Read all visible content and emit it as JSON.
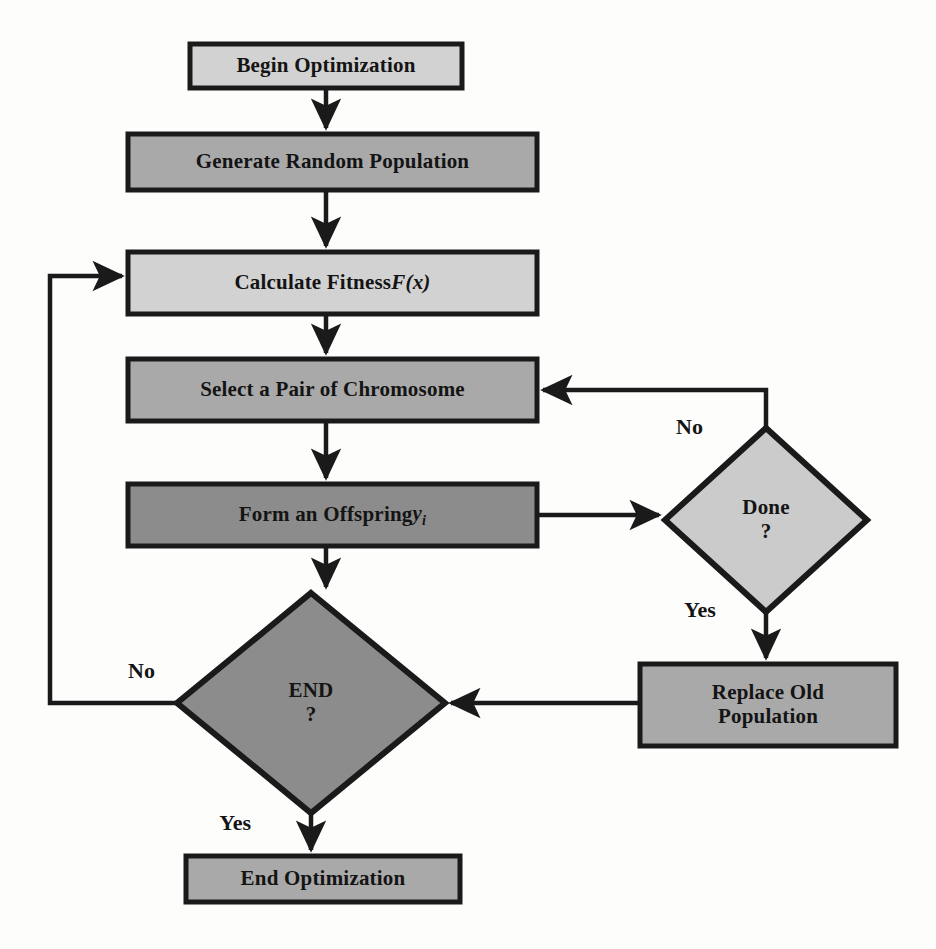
{
  "diagram": {
    "type": "flowchart",
    "background_color": "#fdfdfc",
    "stroke_color": "#1a1a1a",
    "text_color": "#141414",
    "palette": {
      "light_gray": "#d2d2d2",
      "medium_gray": "#a9a9a9",
      "dark_gray": "#8c8c8c",
      "diamond_light": "#cbcbcb",
      "diamond_dark": "#8c8c8c"
    }
  },
  "nodes": {
    "begin": {
      "label": "Begin Optimization",
      "shape": "rectangle",
      "fill": "#d2d2d2",
      "x": 190,
      "y": 44,
      "w": 272,
      "h": 44,
      "font_size": 21
    },
    "generate": {
      "label": "Generate Random Population",
      "shape": "rectangle",
      "fill": "#a9a9a9",
      "x": 128,
      "y": 134,
      "w": 409,
      "h": 56,
      "font_size": 21
    },
    "fitness": {
      "label_prefix": "Calculate Fitness ",
      "label_math": "F(x)",
      "label": "Calculate Fitness F(x)",
      "shape": "rectangle",
      "fill": "#d2d2d2",
      "x": 128,
      "y": 252,
      "w": 409,
      "h": 62,
      "font_size": 21
    },
    "select": {
      "label": "Select a Pair of Chromosome",
      "shape": "rectangle",
      "fill": "#a9a9a9",
      "x": 128,
      "y": 359,
      "w": 409,
      "h": 62,
      "font_size": 21
    },
    "offspring": {
      "label_prefix": "Form an Offspring ",
      "label_math": "y",
      "label_sub": "i",
      "label": "Form an Offspring yi",
      "shape": "rectangle",
      "fill": "#8c8c8c",
      "x": 128,
      "y": 484,
      "w": 409,
      "h": 62,
      "font_size": 21
    },
    "done": {
      "label_line1": "Done",
      "label_line2": "?",
      "label": "Done ?",
      "shape": "diamond",
      "fill": "#cbcbcb",
      "cx": 766,
      "cy": 520,
      "rx": 101,
      "ry": 92,
      "font_size": 21
    },
    "replace": {
      "label_line1": "Replace Old",
      "label_line2": "Population",
      "label": "Replace Old Population",
      "shape": "rectangle",
      "fill": "#a9a9a9",
      "x": 640,
      "y": 664,
      "w": 256,
      "h": 82,
      "font_size": 21
    },
    "end_decision": {
      "label_line1": "END",
      "label_line2": "?",
      "label": "END ?",
      "shape": "diamond",
      "fill": "#8c8c8c",
      "cx": 311,
      "cy": 703,
      "rx": 134,
      "ry": 110,
      "font_size": 21
    },
    "end_opt": {
      "label": "End Optimization",
      "shape": "rectangle",
      "fill": "#a9a9a9",
      "x": 186,
      "y": 856,
      "w": 274,
      "h": 46,
      "font_size": 21
    }
  },
  "edges": [
    {
      "id": "begin-to-generate",
      "from": "begin",
      "to": "generate",
      "label": ""
    },
    {
      "id": "generate-to-fitness",
      "from": "generate",
      "to": "fitness",
      "label": ""
    },
    {
      "id": "fitness-to-select",
      "from": "fitness",
      "to": "select",
      "label": ""
    },
    {
      "id": "select-to-offspring",
      "from": "select",
      "to": "offspring",
      "label": ""
    },
    {
      "id": "offspring-to-done",
      "from": "offspring",
      "to": "done",
      "label": ""
    },
    {
      "id": "done-no-to-select",
      "from": "done",
      "to": "select",
      "label": "No"
    },
    {
      "id": "done-yes-to-replace",
      "from": "done",
      "to": "replace",
      "label": "Yes"
    },
    {
      "id": "replace-to-end-decision",
      "from": "replace",
      "to": "end_decision",
      "label": ""
    },
    {
      "id": "offspring-to-end-decision",
      "from": "offspring",
      "to": "end_decision",
      "label": ""
    },
    {
      "id": "end-no-to-fitness",
      "from": "end_decision",
      "to": "fitness",
      "label": "No"
    },
    {
      "id": "end-yes-to-end-opt",
      "from": "end_decision",
      "to": "end_opt",
      "label": "Yes"
    }
  ],
  "edge_labels": {
    "done_no": {
      "text": "No",
      "x": 676,
      "y": 428
    },
    "done_yes": {
      "text": "Yes",
      "x": 686,
      "y": 610
    },
    "end_no": {
      "text": "No",
      "x": 156,
      "y": 672
    },
    "end_yes": {
      "text": "Yes",
      "x": 252,
      "y": 824
    }
  }
}
